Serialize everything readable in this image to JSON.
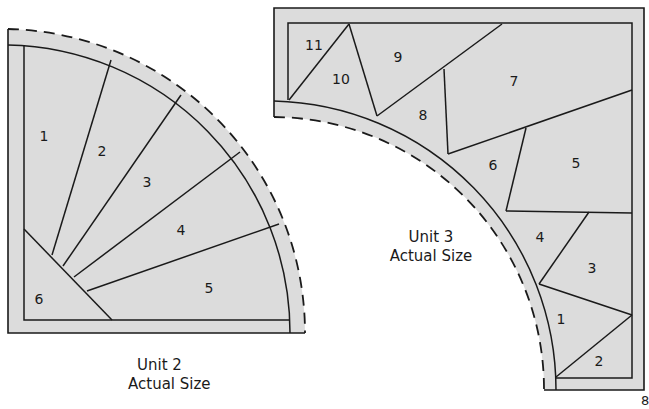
{
  "colors": {
    "fabric_fill": "#dcdcdc",
    "line": "#1a1a1a",
    "background": "#ffffff"
  },
  "unit2": {
    "caption_line1": "Unit 2",
    "caption_line2": "Actual Size",
    "pieces": [
      "1",
      "2",
      "3",
      "4",
      "5",
      "6"
    ]
  },
  "unit3": {
    "caption_line1": "Unit 3",
    "caption_line2": "Actual Size",
    "pieces": [
      "1",
      "2",
      "3",
      "4",
      "5",
      "6",
      "7",
      "8",
      "9",
      "10",
      "11"
    ]
  },
  "page_number_partial": "8"
}
